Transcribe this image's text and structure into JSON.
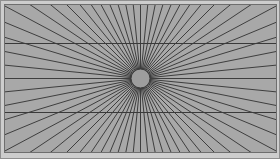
{
  "figure": {
    "name": "hering-illusion",
    "title": "Hering illusion radial fan figure",
    "canvas": {
      "width": 280,
      "height": 159
    },
    "outer_margin": {
      "color": "#cdcdcd",
      "border_color": "#8f8f8f",
      "border_width": 1
    },
    "plot_area": {
      "x": 4,
      "y": 4,
      "width": 273,
      "height": 149,
      "background_color": "#a8a8a8",
      "border_color": "#6e6e6e",
      "border_width": 1
    },
    "vanishing_point": {
      "x": 140.5,
      "y": 78.5
    },
    "rays": {
      "count": 64,
      "color": "#2b2b2b",
      "stroke_width": 0.85,
      "start_angle_deg": 0,
      "angle_step_deg": 5.625,
      "description": "radial lines emanating from the central vanishing point to the edges of the plot area"
    },
    "horizontal_lines": [
      {
        "label": "upper-horizontal-line",
        "y": 43,
        "x1": 4,
        "x2": 277,
        "color": "#3a3a3a",
        "stroke_width": 1
      },
      {
        "label": "lower-horizontal-line",
        "y": 112,
        "x1": 4,
        "x2": 277,
        "color": "#3a3a3a",
        "stroke_width": 1
      }
    ],
    "center_disc": {
      "label": "center-occluder-disc",
      "cx": 140.5,
      "cy": 78.5,
      "r": 9.5,
      "fill": "#9d9d9d",
      "stroke": "#3c3c3c",
      "stroke_width": 1
    }
  }
}
